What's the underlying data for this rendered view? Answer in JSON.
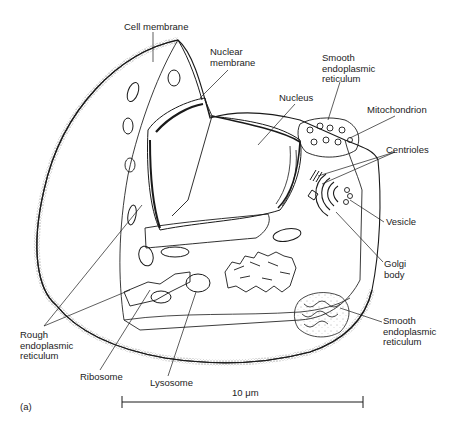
{
  "figure": {
    "panel_label": "(a)",
    "colors": {
      "ink": "#1a1a1a",
      "paper": "#ffffff",
      "stipple": "#555555"
    }
  },
  "labels": [
    {
      "id": "cell-membrane",
      "text": "Cell membrane",
      "x": 124,
      "y": 22
    },
    {
      "id": "nuclear-membrane",
      "text": "Nuclear\nmembrane",
      "x": 210,
      "y": 47
    },
    {
      "id": "smooth-er-top",
      "text": "Smooth\nendoplasmic\nreticulum",
      "x": 322,
      "y": 53
    },
    {
      "id": "nucleus",
      "text": "Nucleus",
      "x": 279,
      "y": 93
    },
    {
      "id": "mitochondrion",
      "text": "Mitochondrion",
      "x": 367,
      "y": 105
    },
    {
      "id": "centrioles",
      "text": "Centrioles",
      "x": 386,
      "y": 145
    },
    {
      "id": "vesicle",
      "text": "Vesicle",
      "x": 386,
      "y": 217
    },
    {
      "id": "golgi-body",
      "text": "Golgi\nbody",
      "x": 384,
      "y": 259
    },
    {
      "id": "smooth-er-bottom",
      "text": "Smooth\nendoplasmic\nreticulum",
      "x": 383,
      "y": 316
    },
    {
      "id": "rough-er",
      "text": "Rough\nendoplasmic\nreticulum",
      "x": 20,
      "y": 330
    },
    {
      "id": "ribosome",
      "text": "Ribosome",
      "x": 80,
      "y": 372
    },
    {
      "id": "lysosome",
      "text": "Lysosome",
      "x": 150,
      "y": 378
    }
  ],
  "scale_bar": {
    "label": "10 μm",
    "x1": 122,
    "x2": 363,
    "y": 402
  }
}
